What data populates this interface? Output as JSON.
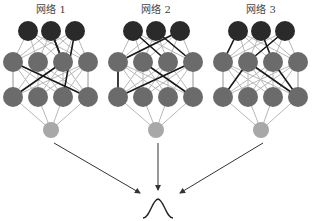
{
  "networks": [
    {
      "label": "网络 1",
      "offset": 0,
      "bold_edges": [
        [
          0,
          1,
          1,
          2
        ],
        [
          1,
          2,
          0,
          1
        ],
        [
          2,
          0,
          1,
          2
        ],
        [
          1,
          0,
          2,
          3
        ],
        [
          2,
          2,
          0,
          2
        ]
      ]
    },
    {
      "label": "网络 2",
      "offset": 105,
      "bold_edges": [
        [
          0,
          0,
          1,
          2
        ],
        [
          0,
          2,
          1,
          0
        ],
        [
          0,
          1,
          1,
          3
        ],
        [
          1,
          0,
          2,
          0
        ],
        [
          1,
          3,
          2,
          0
        ],
        [
          1,
          1,
          2,
          3
        ]
      ]
    },
    {
      "label": "网络 3",
      "offset": 210,
      "bold_edges": [
        [
          0,
          0,
          1,
          0
        ],
        [
          0,
          2,
          1,
          1
        ],
        [
          0,
          1,
          1,
          2
        ],
        [
          1,
          1,
          2,
          0
        ],
        [
          1,
          1,
          2,
          3
        ],
        [
          1,
          2,
          2,
          3
        ]
      ]
    }
  ],
  "colors": {
    "top_node": "#2a2a2a",
    "hidden_node": "#6b6b6b",
    "output_node": "#a8a8a8",
    "edge_light": "#b8b8b8",
    "edge_bold": "#1a1a1a",
    "arrow": "#333333"
  },
  "output": {
    "symbol": "gaussian-distribution",
    "x": 158,
    "y": 218
  }
}
